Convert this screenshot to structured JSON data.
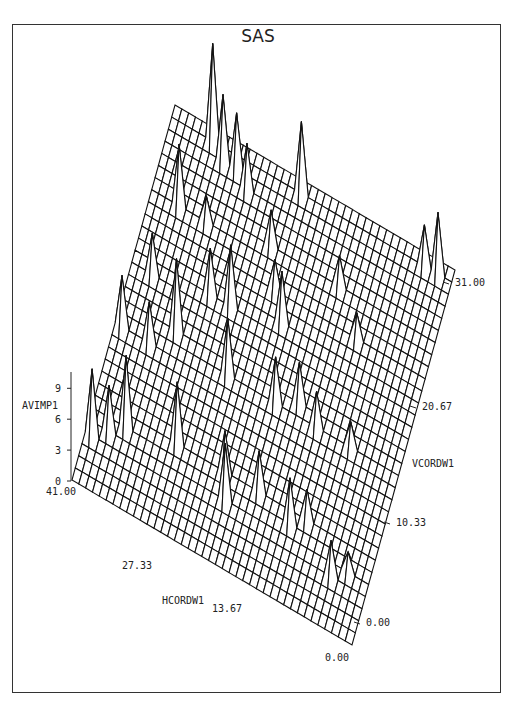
{
  "title": "SAS",
  "chart_data": {
    "type": "surface3d",
    "title": "SAS",
    "zlabel": "AVIMP1",
    "xlabel": "HCORDW1",
    "ylabel": "VCORDW1",
    "z_ticks": [
      "0",
      "3",
      "6",
      "9"
    ],
    "x_ticks": [
      "41.00",
      "27.33",
      "13.67",
      "0.00"
    ],
    "y_ticks": [
      "0.00",
      "10.33",
      "20.67",
      "31.00"
    ],
    "x_range": [
      0,
      41
    ],
    "y_range": [
      0,
      31
    ],
    "z_range": [
      0,
      10
    ],
    "grid": {
      "x_cells": 41,
      "y_cells": 31
    },
    "peaks": [
      {
        "x": 35,
        "y": 30,
        "z": 9.5
      },
      {
        "x": 33,
        "y": 29,
        "z": 6.5
      },
      {
        "x": 31,
        "y": 29,
        "z": 5.5
      },
      {
        "x": 29,
        "y": 28,
        "z": 4.5
      },
      {
        "x": 22,
        "y": 30,
        "z": 7.0
      },
      {
        "x": 2,
        "y": 30,
        "z": 6.0
      },
      {
        "x": 4,
        "y": 30,
        "z": 4.0
      },
      {
        "x": 37,
        "y": 24,
        "z": 6.0
      },
      {
        "x": 33,
        "y": 24,
        "z": 2.5
      },
      {
        "x": 24,
        "y": 25,
        "z": 3.5
      },
      {
        "x": 14,
        "y": 25,
        "z": 3.0
      },
      {
        "x": 38,
        "y": 18,
        "z": 4.0
      },
      {
        "x": 30,
        "y": 19,
        "z": 4.5
      },
      {
        "x": 27,
        "y": 19,
        "z": 6.0
      },
      {
        "x": 22,
        "y": 22,
        "z": 3.0
      },
      {
        "x": 20,
        "y": 20,
        "z": 5.0
      },
      {
        "x": 10,
        "y": 22,
        "z": 2.5
      },
      {
        "x": 40,
        "y": 13,
        "z": 5.0
      },
      {
        "x": 36,
        "y": 13,
        "z": 4.0
      },
      {
        "x": 33,
        "y": 15,
        "z": 7.0
      },
      {
        "x": 25,
        "y": 14,
        "z": 5.5
      },
      {
        "x": 18,
        "y": 14,
        "z": 4.5
      },
      {
        "x": 15,
        "y": 15,
        "z": 4.0
      },
      {
        "x": 12,
        "y": 14,
        "z": 3.5
      },
      {
        "x": 7,
        "y": 14,
        "z": 2.5
      },
      {
        "x": 40,
        "y": 4,
        "z": 6.5
      },
      {
        "x": 38,
        "y": 5,
        "z": 4.5
      },
      {
        "x": 36,
        "y": 6,
        "z": 7.0
      },
      {
        "x": 29,
        "y": 7,
        "z": 6.0
      },
      {
        "x": 22,
        "y": 7,
        "z": 4.0
      },
      {
        "x": 21,
        "y": 5,
        "z": 5.5
      },
      {
        "x": 17,
        "y": 7,
        "z": 4.0
      },
      {
        "x": 12,
        "y": 6,
        "z": 4.5
      },
      {
        "x": 10,
        "y": 7,
        "z": 3.0
      },
      {
        "x": 5,
        "y": 4,
        "z": 3.5
      },
      {
        "x": 3,
        "y": 5,
        "z": 2.0
      }
    ]
  },
  "labels": {
    "z_axis_label": "AVIMP1",
    "x_axis_label": "HCORDW1",
    "y_axis_label": "VCORDW1"
  }
}
